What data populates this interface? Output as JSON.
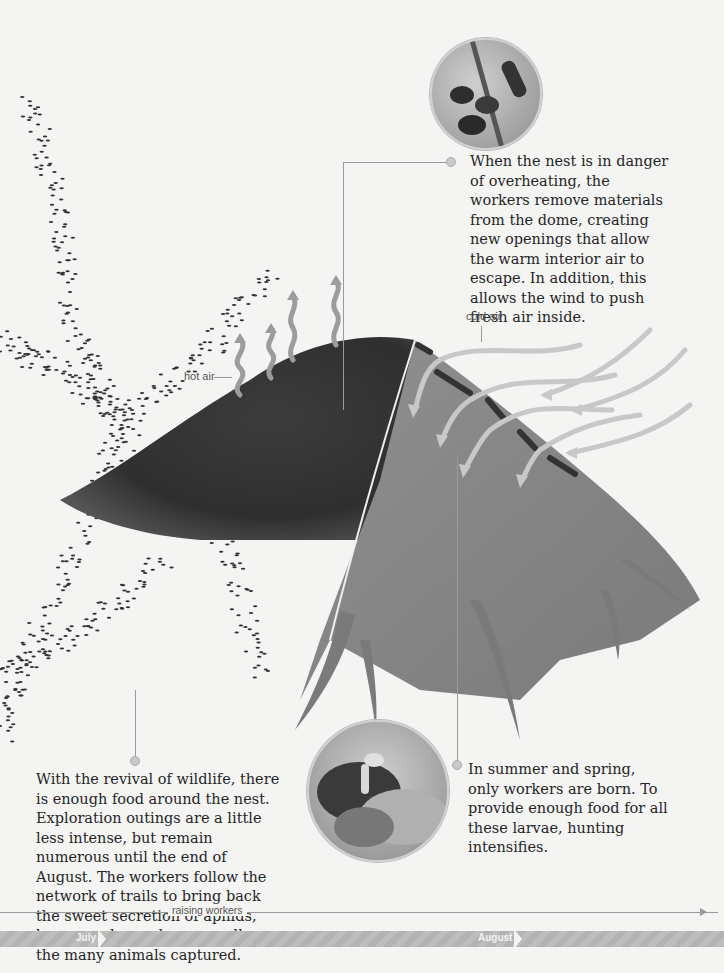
{
  "callouts": {
    "ventilation": "When the nest is in danger of overheating, the workers remove materials from the dome, creating new openings that allow the warm interior air to escape. In addition, this allows the wind to push fresh air inside.",
    "foraging": "With the revival of wildlife, there is enough food around the nest. Exploration outings are a little less intense, but remain numerous until the end of August. The workers follow the network of trails to bring back the sweet secretion of aphids, known as honeydew, as well as the many animals captured.",
    "larvae": "In summer and spring, only workers are born. To provide enough food for all these larvae, hunting intensifies."
  },
  "labels": {
    "hot_air": "hot air",
    "cold_air": "cold air"
  },
  "timeline": {
    "phase": "raising workers",
    "months": [
      "July",
      "August"
    ]
  },
  "images": {
    "top": "ants-on-stem-photo",
    "bottom": "ant-with-prey-photo",
    "main": "anthill-cross-section-illustration"
  },
  "colors": {
    "background": "#f4f4f3",
    "mound": "#3a3a3a",
    "interior": "#8a8a8a",
    "air_arrows": "#c8c8c8",
    "timeline_bar": "#b8b8b8"
  }
}
